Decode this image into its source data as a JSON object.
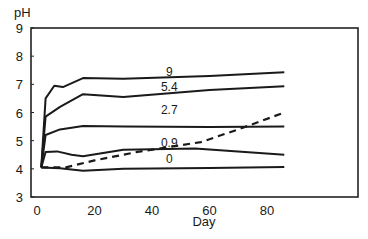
{
  "chart_data": {
    "type": "line",
    "title": "",
    "xlabel": "Day",
    "ylabel": "pH",
    "xlim": [
      -2,
      112
    ],
    "ylim": [
      3,
      9
    ],
    "xticks": [
      0,
      20,
      40,
      60,
      80
    ],
    "yticks": [
      3,
      4,
      5,
      6,
      7,
      8,
      9
    ],
    "grid": false,
    "legend": "none (inline labels)",
    "series": [
      {
        "name": "9",
        "style": "solid",
        "label": "9",
        "points": [
          [
            1.5,
            4.05
          ],
          [
            3,
            6.5
          ],
          [
            6,
            6.95
          ],
          [
            9,
            6.9
          ],
          [
            16,
            7.22
          ],
          [
            30,
            7.2
          ],
          [
            60,
            7.3
          ],
          [
            86,
            7.43
          ]
        ]
      },
      {
        "name": "5.4",
        "style": "solid",
        "label": "5.4",
        "points": [
          [
            1.5,
            4.05
          ],
          [
            3,
            5.85
          ],
          [
            8,
            6.2
          ],
          [
            16,
            6.65
          ],
          [
            30,
            6.55
          ],
          [
            60,
            6.8
          ],
          [
            86,
            6.93
          ]
        ]
      },
      {
        "name": "2.7",
        "style": "solid",
        "label": "2.7",
        "points": [
          [
            1.5,
            4.05
          ],
          [
            3,
            5.2
          ],
          [
            8,
            5.4
          ],
          [
            16,
            5.52
          ],
          [
            30,
            5.5
          ],
          [
            60,
            5.48
          ],
          [
            86,
            5.5
          ]
        ]
      },
      {
        "name": "0.9",
        "style": "solid",
        "label": "0.9",
        "points": [
          [
            1.5,
            4.05
          ],
          [
            3,
            4.6
          ],
          [
            7,
            4.62
          ],
          [
            12,
            4.5
          ],
          [
            16,
            4.45
          ],
          [
            30,
            4.68
          ],
          [
            55,
            4.72
          ],
          [
            86,
            4.5
          ]
        ]
      },
      {
        "name": "0",
        "style": "solid",
        "label": "0",
        "points": [
          [
            1.5,
            4.05
          ],
          [
            8,
            4.02
          ],
          [
            16,
            3.93
          ],
          [
            30,
            4.0
          ],
          [
            60,
            4.03
          ],
          [
            86,
            4.07
          ]
        ]
      },
      {
        "name": "dashed",
        "style": "dashed",
        "label": "",
        "points": [
          [
            1.5,
            4.05
          ],
          [
            10,
            4.05
          ],
          [
            20,
            4.3
          ],
          [
            35,
            4.6
          ],
          [
            57,
            4.95
          ],
          [
            70,
            5.4
          ],
          [
            86,
            6.0
          ]
        ]
      }
    ],
    "annotations": [
      {
        "text": "9",
        "x": 46,
        "y": 7.45
      },
      {
        "text": "5.4",
        "x": 46,
        "y": 6.9
      },
      {
        "text": "2.7",
        "x": 46,
        "y": 6.1
      },
      {
        "text": "0.9",
        "x": 46,
        "y": 4.9
      },
      {
        "text": "0",
        "x": 46,
        "y": 4.35
      }
    ]
  }
}
